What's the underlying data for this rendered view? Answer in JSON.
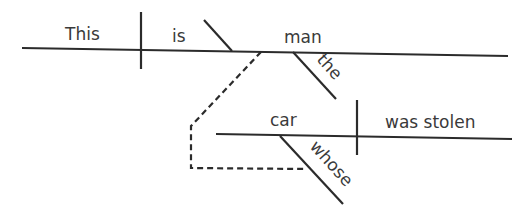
{
  "diagram": {
    "type": "sentence-diagram",
    "sentence": "This is the man whose car was stolen",
    "main_clause": {
      "subject": "This",
      "verb": "is",
      "predicate_nominative": "man",
      "modifier": "the"
    },
    "relative_clause": {
      "subject": "car",
      "verb": "was stolen",
      "modifier": "whose"
    }
  }
}
